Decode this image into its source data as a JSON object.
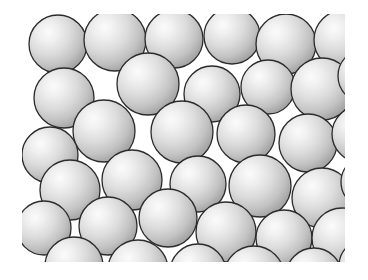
{
  "figure": {
    "kind": "sphere-packing-illustration",
    "canvas": {
      "width": 368,
      "height": 280,
      "background": "#ffffff"
    },
    "content_box": {
      "x": 22,
      "y": 14,
      "width": 323,
      "height": 248
    },
    "style": {
      "sphere_fill_highlight": "#fbfbfb",
      "sphere_fill_mid": "#dcdcdc",
      "sphere_fill_edge": "#a6a6a6",
      "sphere_stroke": "#2b2b2b",
      "sphere_stroke_width": 1.3,
      "highlight_center_x_pct": 33,
      "highlight_center_y_pct": 30,
      "highlight_radius_pct": 72
    },
    "sphere_count": 36,
    "spheres": [
      {
        "cx": 36,
        "cy": 30,
        "r": 29
      },
      {
        "cx": 93,
        "cy": 26,
        "r": 31
      },
      {
        "cx": 152,
        "cy": 25,
        "r": 29
      },
      {
        "cx": 210,
        "cy": 22,
        "r": 28
      },
      {
        "cx": 264,
        "cy": 30,
        "r": 30
      },
      {
        "cx": 322,
        "cy": 26,
        "r": 30
      },
      {
        "cx": 42,
        "cy": 84,
        "r": 30
      },
      {
        "cx": 126,
        "cy": 70,
        "r": 31
      },
      {
        "cx": 190,
        "cy": 80,
        "r": 28
      },
      {
        "cx": 246,
        "cy": 73,
        "r": 27
      },
      {
        "cx": 300,
        "cy": 75,
        "r": 31
      },
      {
        "cx": 343,
        "cy": 62,
        "r": 27
      },
      {
        "cx": 82,
        "cy": 117,
        "r": 31
      },
      {
        "cx": 160,
        "cy": 118,
        "r": 31
      },
      {
        "cx": 224,
        "cy": 120,
        "r": 29
      },
      {
        "cx": 286,
        "cy": 129,
        "r": 29
      },
      {
        "cx": 338,
        "cy": 120,
        "r": 28
      },
      {
        "cx": 28,
        "cy": 141,
        "r": 28
      },
      {
        "cx": 48,
        "cy": 176,
        "r": 30
      },
      {
        "cx": 110,
        "cy": 166,
        "r": 30
      },
      {
        "cx": 176,
        "cy": 170,
        "r": 28
      },
      {
        "cx": 238,
        "cy": 172,
        "r": 31
      },
      {
        "cx": 300,
        "cy": 184,
        "r": 30
      },
      {
        "cx": 345,
        "cy": 168,
        "r": 26
      },
      {
        "cx": 22,
        "cy": 214,
        "r": 27
      },
      {
        "cx": 86,
        "cy": 212,
        "r": 29
      },
      {
        "cx": 146,
        "cy": 204,
        "r": 29
      },
      {
        "cx": 204,
        "cy": 218,
        "r": 30
      },
      {
        "cx": 262,
        "cy": 224,
        "r": 28
      },
      {
        "cx": 320,
        "cy": 224,
        "r": 30
      },
      {
        "cx": 52,
        "cy": 252,
        "r": 29
      },
      {
        "cx": 116,
        "cy": 256,
        "r": 30
      },
      {
        "cx": 176,
        "cy": 258,
        "r": 28
      },
      {
        "cx": 232,
        "cy": 262,
        "r": 30
      },
      {
        "cx": 292,
        "cy": 262,
        "r": 28
      },
      {
        "cx": 344,
        "cy": 252,
        "r": 27
      }
    ]
  }
}
